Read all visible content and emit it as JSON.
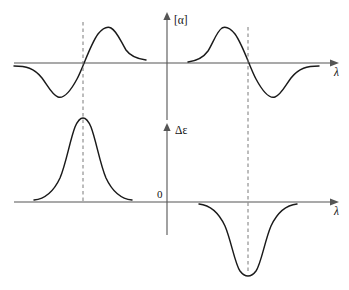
{
  "figure": {
    "background_color": "#ffffff",
    "curve_color": "#1a1a1a",
    "axis_color": "#555555",
    "marker_color": "#7a7a7a",
    "width": 349,
    "height": 290
  },
  "labels": {
    "ord_y_axis": "[α]",
    "cd_y_axis": "Δε",
    "x_axis_top": "λ",
    "x_axis_bottom": "λ",
    "origin": "0"
  },
  "chart_data": {
    "type": "line",
    "xlabel": "λ",
    "ylabel": "[α] / Δε",
    "grid": false,
    "legend": "none",
    "panels": [
      {
        "name": "ord-panel",
        "ylabel": "[α]",
        "xlabel": "λ",
        "baseline_y": 63,
        "axis_x": 167,
        "axis_top_y": 14,
        "axis_bottom_y": 185,
        "x_axis_start": 14,
        "x_axis_end": 334,
        "series": [
          {
            "name": "ord-curve-left",
            "description": "negative-then-positive S-shaped ORD Cotton effect curve, zero crossing at marker",
            "zero_crossing_x": 83,
            "trough": {
              "x": 58,
              "y": 97
            },
            "peak": {
              "x": 110,
              "y": 28
            },
            "path": "M 14,66 C 26,66 34,68 42,78 C 48,86 52,95 58,97 C 64,99 70,92 77,79 C 83,68 90,45 98,34 C 103,28 107,26 111,28 C 117,31 121,42 126,50 C 131,57 138,59 146,60"
          },
          {
            "name": "ord-curve-right",
            "description": "positive-then-negative S-shaped ORD Cotton effect curve, zero crossing at marker",
            "zero_crossing_x": 248,
            "peak": {
              "x": 222,
              "y": 28
            },
            "trough": {
              "x": 275,
              "y": 96
            },
            "path": "M 188,62 C 196,61 203,58 208,51 C 213,43 217,31 222,28 C 226,26 230,28 235,34 C 243,45 250,68 256,79 C 263,92 269,99 275,97 C 281,95 285,86 291,78 C 299,68 307,66 319,66"
          }
        ]
      },
      {
        "name": "cd-panel",
        "ylabel": "Δε",
        "xlabel": "λ",
        "baseline_y": 202,
        "axis_x": 167,
        "axis_top_y": 124,
        "axis_bottom_y": 235,
        "x_axis_start": 14,
        "x_axis_end": 334,
        "series": [
          {
            "name": "cd-curve-left",
            "description": "positive Gaussian CD band centered on marker wavelength",
            "center_x": 83,
            "apex": {
              "x": 83,
              "y": 118
            },
            "path": "M 34,200 C 44,199 53,193 60,178 C 66,164 70,140 75,127 C 78,120 81,118 83,118 C 85,118 88,120 91,127 C 96,140 100,164 106,178 C 113,193 122,199 132,200"
          },
          {
            "name": "cd-curve-right",
            "description": "negative Gaussian CD band centered on marker wavelength",
            "center_x": 248,
            "apex": {
              "x": 248,
              "y": 272
            },
            "path": "M 199,204 C 209,205 218,211 225,226 C 231,240 235,264 240,271 C 243,275 246,276 248,276 C 250,276 253,275 256,271 C 261,264 265,240 271,226 C 278,211 287,205 297,204"
          }
        ]
      }
    ],
    "markers": [
      {
        "name": "marker-line-left",
        "x": 83,
        "y_top": 22,
        "y_bottom": 202,
        "style": "dashed",
        "description": "vertical dashed line linking left ORD zero-crossing to left CD band maximum"
      },
      {
        "name": "marker-line-right",
        "x": 248,
        "y_top": 27,
        "y_bottom": 272,
        "style": "dashed",
        "description": "vertical dashed line linking right ORD zero-crossing to right CD band minimum"
      }
    ]
  }
}
